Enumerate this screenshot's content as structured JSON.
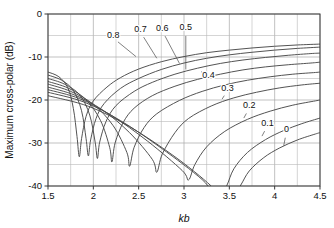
{
  "chart_data": {
    "type": "line",
    "title": "",
    "xlabel": "kb",
    "ylabel": "Maximum cross-polar (dB)",
    "xlim": [
      1.5,
      4.5
    ],
    "ylim": [
      -40,
      0
    ],
    "xticks": [
      "1.5",
      "2",
      "2.5",
      "3",
      "3.5",
      "4",
      "4.5"
    ],
    "xtick_values": [
      1.5,
      2,
      2.5,
      3,
      3.5,
      4,
      4.5
    ],
    "yticks": [
      "0",
      "-10",
      "-20",
      "-30",
      "-40"
    ],
    "ytick_values": [
      0,
      -10,
      -20,
      -30,
      -40
    ],
    "grid": true,
    "grid_x_step": 0.25,
    "grid_y_step": 5,
    "legend": "inline-curve-labels",
    "legend_position": "inline",
    "series": [
      {
        "name": "0.8",
        "label": "0.8",
        "label_x": 2.22,
        "label_y": -5.6,
        "leader_to_x": 2.47,
        "leader_to_y": -9.9,
        "points": [
          [
            1.5,
            -13.5
          ],
          [
            1.62,
            -14.6
          ],
          [
            1.72,
            -17.2
          ],
          [
            1.78,
            -22.0
          ],
          [
            1.82,
            -28.5
          ],
          [
            1.845,
            -33.2
          ],
          [
            1.87,
            -29.0
          ],
          [
            1.92,
            -23.8
          ],
          [
            2.0,
            -20.2
          ],
          [
            2.15,
            -17.0
          ],
          [
            2.3,
            -14.8
          ],
          [
            2.5,
            -12.8
          ],
          [
            2.75,
            -11.1
          ],
          [
            3.0,
            -9.9
          ],
          [
            3.25,
            -9.0
          ],
          [
            3.5,
            -8.4
          ],
          [
            3.75,
            -7.9
          ],
          [
            4.0,
            -7.5
          ],
          [
            4.25,
            -7.2
          ],
          [
            4.5,
            -7.0
          ]
        ]
      },
      {
        "name": "0.7",
        "label": "0.7",
        "label_x": 2.52,
        "label_y": -4.2,
        "leader_to_x": 2.7,
        "leader_to_y": -10.3,
        "points": [
          [
            1.5,
            -14.2
          ],
          [
            1.65,
            -15.4
          ],
          [
            1.78,
            -17.8
          ],
          [
            1.87,
            -22.5
          ],
          [
            1.92,
            -29.0
          ],
          [
            1.945,
            -33.0
          ],
          [
            1.97,
            -29.3
          ],
          [
            2.03,
            -24.3
          ],
          [
            2.12,
            -20.8
          ],
          [
            2.3,
            -17.3
          ],
          [
            2.5,
            -15.0
          ],
          [
            2.75,
            -12.9
          ],
          [
            3.0,
            -11.4
          ],
          [
            3.25,
            -10.3
          ],
          [
            3.5,
            -9.5
          ],
          [
            3.75,
            -8.9
          ],
          [
            4.0,
            -8.4
          ],
          [
            4.25,
            -8.0
          ],
          [
            4.5,
            -7.7
          ]
        ]
      },
      {
        "name": "0.6",
        "label": "0.6",
        "label_x": 2.76,
        "label_y": -3.9,
        "leader_to_x": 2.95,
        "leader_to_y": -11.5,
        "points": [
          [
            1.5,
            -15.0
          ],
          [
            1.68,
            -16.3
          ],
          [
            1.85,
            -18.8
          ],
          [
            1.96,
            -23.5
          ],
          [
            2.02,
            -29.8
          ],
          [
            2.045,
            -33.6
          ],
          [
            2.07,
            -29.8
          ],
          [
            2.14,
            -25.0
          ],
          [
            2.25,
            -21.3
          ],
          [
            2.45,
            -18.0
          ],
          [
            2.65,
            -15.9
          ],
          [
            2.9,
            -14.0
          ],
          [
            3.15,
            -12.6
          ],
          [
            3.4,
            -11.5
          ],
          [
            3.65,
            -10.7
          ],
          [
            3.9,
            -10.1
          ],
          [
            4.15,
            -9.6
          ],
          [
            4.4,
            -9.2
          ],
          [
            4.5,
            -9.1
          ]
        ]
      },
      {
        "name": "0.5",
        "label": "0.5",
        "label_x": 3.02,
        "label_y": -3.7,
        "leader_to_x": 3.02,
        "leader_to_y": -12.9,
        "points": [
          [
            1.5,
            -15.7
          ],
          [
            1.72,
            -17.2
          ],
          [
            1.92,
            -19.9
          ],
          [
            2.08,
            -24.8
          ],
          [
            2.18,
            -31.0
          ],
          [
            2.205,
            -34.4
          ],
          [
            2.24,
            -30.0
          ],
          [
            2.33,
            -25.2
          ],
          [
            2.45,
            -21.9
          ],
          [
            2.65,
            -19.0
          ],
          [
            2.9,
            -16.8
          ],
          [
            3.15,
            -15.2
          ],
          [
            3.4,
            -14.0
          ],
          [
            3.65,
            -13.0
          ],
          [
            3.9,
            -12.3
          ],
          [
            4.15,
            -11.8
          ],
          [
            4.4,
            -11.4
          ],
          [
            4.5,
            -11.2
          ]
        ]
      },
      {
        "name": "0.4",
        "label": "0.4",
        "label_x": 3.27,
        "label_y": -14.9,
        "leader_to_x": 3.19,
        "leader_to_y": -13.4,
        "points": [
          [
            1.5,
            -16.3
          ],
          [
            1.75,
            -18.0
          ],
          [
            2.0,
            -21.0
          ],
          [
            2.22,
            -26.0
          ],
          [
            2.37,
            -32.2
          ],
          [
            2.4,
            -35.4
          ],
          [
            2.45,
            -31.0
          ],
          [
            2.56,
            -26.4
          ],
          [
            2.7,
            -23.2
          ],
          [
            2.95,
            -20.1
          ],
          [
            3.2,
            -18.0
          ],
          [
            3.45,
            -16.5
          ],
          [
            3.7,
            -15.4
          ],
          [
            3.95,
            -14.6
          ],
          [
            4.2,
            -14.0
          ],
          [
            4.45,
            -13.6
          ],
          [
            4.5,
            -13.5
          ]
        ]
      },
      {
        "name": "0.3",
        "label": "0.3",
        "label_x": 3.48,
        "label_y": -17.8,
        "leader_to_x": 3.42,
        "leader_to_y": -19.8,
        "points": [
          [
            1.5,
            -17.0
          ],
          [
            1.8,
            -18.9
          ],
          [
            2.1,
            -22.3
          ],
          [
            2.4,
            -27.6
          ],
          [
            2.65,
            -33.8
          ],
          [
            2.7,
            -36.8
          ],
          [
            2.76,
            -32.6
          ],
          [
            2.9,
            -27.6
          ],
          [
            3.05,
            -24.3
          ],
          [
            3.3,
            -21.4
          ],
          [
            3.55,
            -19.5
          ],
          [
            3.8,
            -18.2
          ],
          [
            4.05,
            -17.2
          ],
          [
            4.3,
            -16.5
          ],
          [
            4.5,
            -16.1
          ]
        ]
      },
      {
        "name": "0.2",
        "label": "0.2",
        "label_x": 3.72,
        "label_y": -21.9,
        "leader_to_x": 3.66,
        "leader_to_y": -24.2,
        "points": [
          [
            1.5,
            -17.6
          ],
          [
            1.85,
            -19.7
          ],
          [
            2.2,
            -23.6
          ],
          [
            2.6,
            -29.6
          ],
          [
            2.98,
            -36.4
          ],
          [
            3.05,
            -38.6
          ],
          [
            3.12,
            -35.0
          ],
          [
            3.25,
            -30.9
          ],
          [
            3.45,
            -27.3
          ],
          [
            3.7,
            -24.5
          ],
          [
            3.95,
            -22.6
          ],
          [
            4.2,
            -21.2
          ],
          [
            4.45,
            -20.2
          ],
          [
            4.5,
            -20.0
          ]
        ]
      },
      {
        "name": "0.1",
        "label": "0.1",
        "label_x": 3.92,
        "label_y": -26.0,
        "leader_to_x": 3.86,
        "leader_to_y": -28.4,
        "points": [
          [
            1.5,
            -18.2
          ],
          [
            1.9,
            -20.5
          ],
          [
            2.3,
            -24.8
          ],
          [
            2.75,
            -31.2
          ],
          [
            3.2,
            -38.5
          ],
          [
            3.38,
            -43.0
          ],
          [
            3.47,
            -40.0
          ],
          [
            3.55,
            -36.0
          ],
          [
            3.7,
            -32.2
          ],
          [
            3.9,
            -29.2
          ],
          [
            4.1,
            -27.1
          ],
          [
            4.3,
            -25.5
          ],
          [
            4.5,
            -24.2
          ]
        ]
      },
      {
        "name": "0",
        "label": "0",
        "label_x": 4.13,
        "label_y": -27.4,
        "leader_to_x": 4.1,
        "leader_to_y": -30.6,
        "points": [
          [
            1.5,
            -19.0
          ],
          [
            1.95,
            -21.5
          ],
          [
            2.4,
            -26.2
          ],
          [
            2.9,
            -33.2
          ],
          [
            3.3,
            -40.0
          ],
          [
            3.48,
            -44.5
          ],
          [
            3.62,
            -40.0
          ],
          [
            3.72,
            -36.5
          ],
          [
            3.88,
            -33.4
          ],
          [
            4.05,
            -31.2
          ],
          [
            4.25,
            -29.3
          ],
          [
            4.45,
            -27.9
          ],
          [
            4.5,
            -27.6
          ]
        ]
      }
    ]
  },
  "axes": {
    "x_label": "kb",
    "y_label": "Maximum cross-polar (dB)"
  }
}
